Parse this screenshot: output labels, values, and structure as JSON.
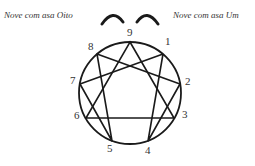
{
  "diagram": {
    "type": "enneagram",
    "wing_labels": {
      "left": "Nove com asa Oito",
      "right": "Nove com asa Um"
    },
    "points": [
      {
        "number": "9"
      },
      {
        "number": "1"
      },
      {
        "number": "2"
      },
      {
        "number": "3"
      },
      {
        "number": "4"
      },
      {
        "number": "5"
      },
      {
        "number": "6"
      },
      {
        "number": "7"
      },
      {
        "number": "8"
      }
    ],
    "connections": {
      "triangle": [
        "9",
        "3",
        "6"
      ],
      "hexad": [
        "1",
        "4",
        "2",
        "8",
        "5",
        "7",
        "1"
      ]
    },
    "highlight": "9 with wings 8 and 1 (arcs)",
    "stroke_color": "#1a1a1a"
  }
}
